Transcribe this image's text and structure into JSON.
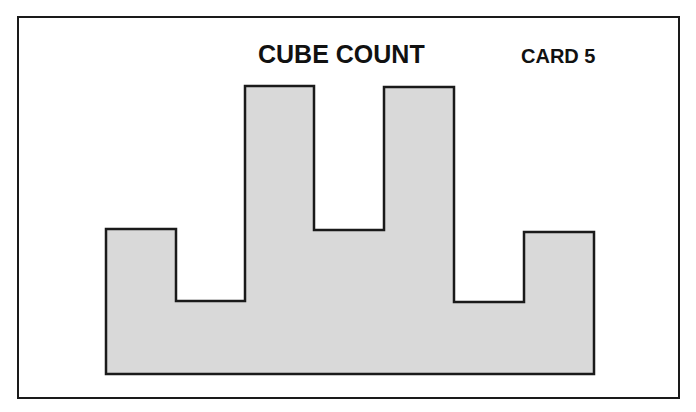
{
  "card": {
    "title": "CUBE COUNT",
    "label": "CARD 5"
  },
  "shape": {
    "fill": "#d9d9d9",
    "stroke": "#1a1a1a",
    "description": "Stepped block silhouette: two short outer columns, two tall towers, lower middle step",
    "points": "106,229 176,229 176,301 245,301 245,86 314,86 314,230 384,230 384,87 454,87 454,302 524,302 524,232 594,232 594,374 106,374"
  }
}
